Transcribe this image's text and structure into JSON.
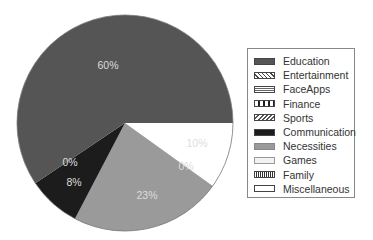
{
  "chart_data": {
    "type": "pie",
    "title": "",
    "start_angle_deg": 0,
    "direction": "clockwise",
    "slices": [
      {
        "label": "Miscellaneous",
        "value": 10,
        "display": "10%",
        "color": "#ffffff",
        "pattern": "none"
      },
      {
        "label": "Family",
        "value": 0,
        "display": "",
        "color": "#ffffff",
        "pattern": "grid"
      },
      {
        "label": "Games",
        "value": 0,
        "display": "0%",
        "color": "#f0f0f0",
        "pattern": "light"
      },
      {
        "label": "Necessities",
        "value": 23,
        "display": "23%",
        "color": "#9a9a9a",
        "pattern": "none"
      },
      {
        "label": "Communication",
        "value": 8,
        "display": "8%",
        "color": "#1c1c1c",
        "pattern": "none"
      },
      {
        "label": "Sports",
        "value": 0,
        "display": "0%",
        "color": "#cccccc",
        "pattern": "diagonal"
      },
      {
        "label": "Finance",
        "value": 0,
        "display": "",
        "color": "#ffffff",
        "pattern": "vertical"
      },
      {
        "label": "FaceApps",
        "value": 0,
        "display": "",
        "color": "#bbbbbb",
        "pattern": "horizontal"
      },
      {
        "label": "Entertainment",
        "value": 0,
        "display": "",
        "color": "#ffffff",
        "pattern": "checker"
      },
      {
        "label": "Education",
        "value": 60,
        "display": "60%",
        "color": "#555555",
        "pattern": "none"
      }
    ],
    "labels": [
      {
        "text": "60%",
        "x": 108,
        "y": 69,
        "color": "#dddddd"
      },
      {
        "text": "10%",
        "x": 197,
        "y": 147,
        "color": "#444444"
      },
      {
        "text": "0%",
        "x": 186,
        "y": 170,
        "color": "#555555"
      },
      {
        "text": "23%",
        "x": 147,
        "y": 199,
        "color": "#333333"
      },
      {
        "text": "0%",
        "x": 70,
        "y": 166,
        "color": "#dddddd"
      },
      {
        "text": "8%",
        "x": 74,
        "y": 186,
        "color": "#dddddd"
      }
    ],
    "legend": {
      "position": "right",
      "entries": [
        "Education",
        "Entertainment",
        "FaceApps",
        "Finance",
        "Sports",
        "Communication",
        "Necessities",
        "Games",
        "Family",
        "Miscellaneous"
      ]
    }
  },
  "legend": {
    "items": [
      {
        "label": "Education",
        "swatch": "solid-dark"
      },
      {
        "label": "Entertainment",
        "swatch": "checker"
      },
      {
        "label": "FaceApps",
        "swatch": "horizontal"
      },
      {
        "label": "Finance",
        "swatch": "vertical"
      },
      {
        "label": "Sports",
        "swatch": "diagonal"
      },
      {
        "label": "Communication",
        "swatch": "solid-black"
      },
      {
        "label": "Necessities",
        "swatch": "solid-gray"
      },
      {
        "label": "Games",
        "swatch": "light"
      },
      {
        "label": "Family",
        "swatch": "grid"
      },
      {
        "label": "Miscellaneous",
        "swatch": "empty"
      }
    ]
  }
}
